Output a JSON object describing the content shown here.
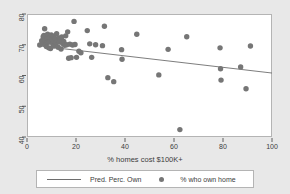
{
  "chart_data": {
    "type": "scatter",
    "title": "",
    "xlabel": "% homes cost $100K+",
    "ylabel": "",
    "xlim": [
      0,
      100
    ],
    "ylim": [
      38,
      80
    ],
    "xticks": [
      0,
      20,
      40,
      60,
      80,
      100
    ],
    "yticks": [
      40,
      50,
      60,
      70,
      80
    ],
    "grid": false,
    "legend_position": "bottom",
    "colors": {
      "marker": "#767676",
      "line": "#6e6e6e",
      "panel_background": "#ffffff",
      "figure_background": "#e8e8e8",
      "frame": "#b4b4b4",
      "text": "#3c3c3c"
    },
    "series": [
      {
        "name": "% who own home",
        "type": "scatter",
        "marker": "circle",
        "points": [
          [
            5.2,
            69.9
          ],
          [
            6.0,
            71.3
          ],
          [
            6.3,
            70.5
          ],
          [
            6.6,
            72.6
          ],
          [
            6.9,
            73.0
          ],
          [
            7.2,
            75.2
          ],
          [
            7.4,
            71.6
          ],
          [
            7.6,
            70.1
          ],
          [
            7.9,
            69.4
          ],
          [
            8.1,
            72.1
          ],
          [
            8.4,
            73.4
          ],
          [
            8.6,
            70.8
          ],
          [
            8.9,
            69.0
          ],
          [
            9.1,
            71.0
          ],
          [
            9.4,
            72.4
          ],
          [
            9.6,
            68.8
          ],
          [
            9.9,
            73.2
          ],
          [
            10.2,
            71.8
          ],
          [
            10.5,
            70.3
          ],
          [
            10.8,
            72.8
          ],
          [
            11.0,
            69.6
          ],
          [
            11.3,
            71.2
          ],
          [
            11.6,
            72.0
          ],
          [
            11.9,
            70.6
          ],
          [
            12.1,
            73.6
          ],
          [
            12.4,
            71.4
          ],
          [
            12.7,
            69.2
          ],
          [
            13.0,
            72.2
          ],
          [
            13.3,
            70.9
          ],
          [
            13.6,
            71.7
          ],
          [
            13.9,
            68.6
          ],
          [
            14.2,
            72.5
          ],
          [
            14.6,
            70.4
          ],
          [
            15.0,
            71.1
          ],
          [
            15.4,
            69.8
          ],
          [
            15.8,
            72.9
          ],
          [
            16.2,
            70.0
          ],
          [
            16.6,
            74.2
          ],
          [
            17.0,
            65.6
          ],
          [
            17.5,
            70.2
          ],
          [
            18.0,
            65.8
          ],
          [
            18.6,
            69.9
          ],
          [
            19.2,
            77.6
          ],
          [
            19.6,
            70.1
          ],
          [
            20.2,
            65.9
          ],
          [
            21.2,
            67.9
          ],
          [
            22.0,
            67.4
          ],
          [
            24.6,
            74.6
          ],
          [
            25.6,
            70.3
          ],
          [
            26.4,
            65.9
          ],
          [
            28.0,
            70.0
          ],
          [
            30.8,
            69.7
          ],
          [
            31.6,
            76.0
          ],
          [
            33.0,
            59.3
          ],
          [
            35.4,
            58.0
          ],
          [
            38.6,
            68.4
          ],
          [
            38.8,
            65.3
          ],
          [
            44.8,
            73.4
          ],
          [
            53.8,
            60.2
          ],
          [
            57.6,
            68.5
          ],
          [
            62.4,
            42.4
          ],
          [
            65.2,
            72.6
          ],
          [
            78.8,
            69.0
          ],
          [
            79.0,
            62.2
          ],
          [
            79.2,
            58.5
          ],
          [
            87.2,
            62.8
          ],
          [
            89.4,
            55.7
          ],
          [
            91.2,
            69.6
          ]
        ]
      },
      {
        "name": "Pred. Perc. Own",
        "type": "line",
        "endpoints": [
          [
            5.2,
            69.6
          ],
          [
            100.0,
            60.8
          ]
        ]
      }
    ],
    "legend": [
      {
        "label": "Pred. Perc. Own",
        "marker": "line"
      },
      {
        "label": "% who own home",
        "marker": "circle"
      }
    ]
  }
}
